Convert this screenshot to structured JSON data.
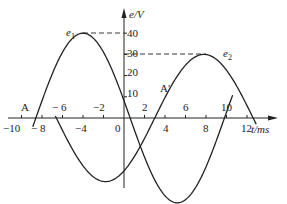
{
  "chart_data": {
    "type": "line",
    "title": "",
    "xlabel": "t/ms",
    "ylabel": "e/V",
    "xlim": [
      -10,
      14
    ],
    "ylim": [
      -40,
      45
    ],
    "grid": false,
    "x_ticks": [
      "-10",
      "-8",
      "-6",
      "-4",
      "-2",
      "0",
      "2",
      "4",
      "6",
      "8",
      "10",
      "12"
    ],
    "x_tick_labels_below": [
      "-10",
      "-8",
      "-4",
      "0",
      "4",
      "8",
      "12"
    ],
    "x_tick_labels_above": [
      "-6",
      "-2",
      "2",
      "6",
      "10"
    ],
    "y_ticks": [
      "10",
      "20",
      "30",
      "40"
    ],
    "series": [
      {
        "name": "e1",
        "label": "e₁",
        "amplitude": 40,
        "peak_t": -4,
        "zero_cross_t": [
          -8.6,
          0.6
        ],
        "points": [
          [
            -8.6,
            0
          ],
          [
            -6,
            30
          ],
          [
            -4,
            40
          ],
          [
            -2,
            28
          ],
          [
            0,
            10
          ],
          [
            0.6,
            0
          ],
          [
            2,
            -14
          ],
          [
            4,
            -33
          ],
          [
            6,
            -39
          ],
          [
            8,
            -28
          ],
          [
            10,
            -8
          ]
        ]
      },
      {
        "name": "e2",
        "label": "e₂",
        "amplitude": 30,
        "peak_t": 8,
        "zero_cross_t": [
          3,
          12.6
        ],
        "points": [
          [
            -6.5,
            0
          ],
          [
            -4,
            -22
          ],
          [
            -2,
            -33
          ],
          [
            0,
            -28
          ],
          [
            2,
            -10
          ],
          [
            3,
            0
          ],
          [
            4,
            8
          ],
          [
            6,
            24
          ],
          [
            8,
            30
          ],
          [
            10,
            22
          ],
          [
            12,
            6
          ],
          [
            12.6,
            0
          ]
        ]
      }
    ],
    "annotations": [
      {
        "text": "A",
        "t": -8.6,
        "e": 0
      },
      {
        "text": "A'",
        "t": 3,
        "e": 0
      },
      {
        "text": "40",
        "dashed_from": "e1 peak",
        "value": 40
      },
      {
        "text": "30",
        "dashed_from": "e2 peak",
        "value": 30
      }
    ],
    "legend": "inline"
  },
  "labels": {
    "y_axis": "e/V",
    "x_axis": "t/ms",
    "e1": "e",
    "e1_sub": "1",
    "e2": "e",
    "e2_sub": "2",
    "point_a": "A",
    "point_a_prime": "A′",
    "y10": "10",
    "y20": "20",
    "y30": "30",
    "y40": "40",
    "x_m10": "−10",
    "x_m8": "− 8",
    "x_m6": "− 6",
    "x_m4": "−4",
    "x_m2": "−2",
    "x_0": "0",
    "x_2": "2",
    "x_4": "4",
    "x_6": "6",
    "x_8": "8",
    "x_10": "10",
    "x_12": "12"
  }
}
